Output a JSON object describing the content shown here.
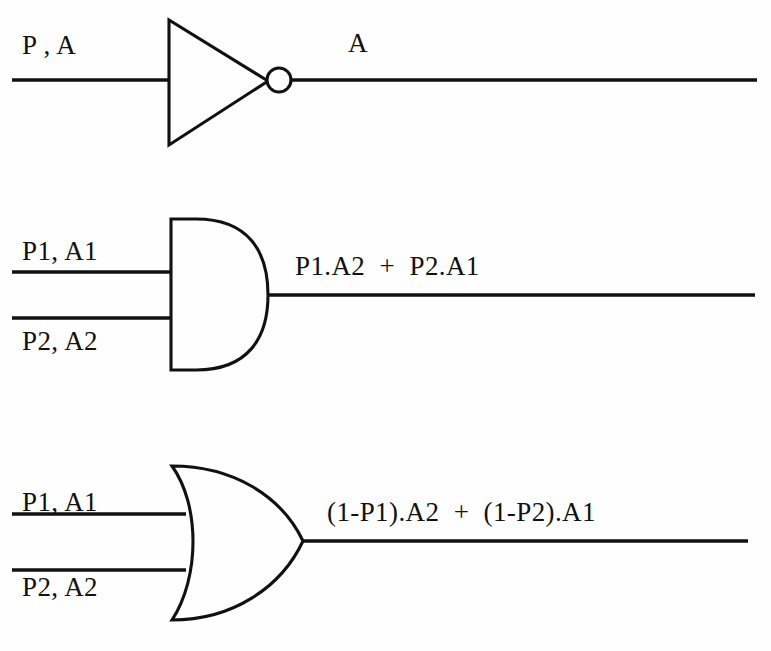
{
  "diagram": {
    "background_color": "#fefefe",
    "line_color": "#111111",
    "rows": [
      {
        "gate": "NOT",
        "gate_icon": "not-gate-icon",
        "inputs": [
          {
            "label": "P , A"
          }
        ],
        "output": {
          "label": "A"
        }
      },
      {
        "gate": "AND",
        "gate_icon": "and-gate-icon",
        "inputs": [
          {
            "label": "P1, A1"
          },
          {
            "label": "P2, A2"
          }
        ],
        "output": {
          "label": "P1.A2  +  P2.A1"
        }
      },
      {
        "gate": "OR",
        "gate_icon": "or-gate-icon",
        "inputs": [
          {
            "label": "P1, A1"
          },
          {
            "label": "P2, A2"
          }
        ],
        "output": {
          "label": "(1-P1).A2  +  (1-P2).A1"
        }
      }
    ]
  }
}
